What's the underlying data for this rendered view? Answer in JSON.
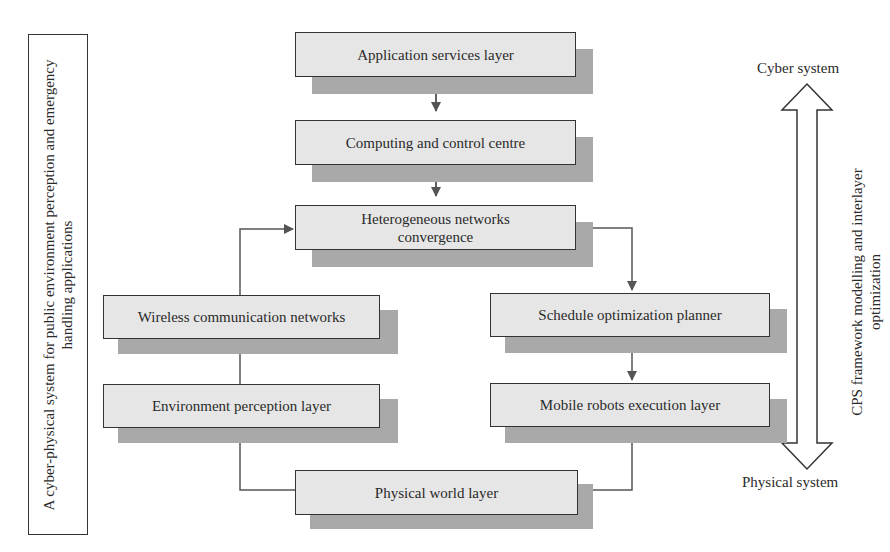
{
  "side_panel": {
    "label": "A cyber-physical system for public environment perception and emergency handling applications"
  },
  "nodes": {
    "application_services": "Application services layer",
    "computing_control": "Computing and control centre",
    "heterogeneous_networks": "Heterogeneous networks convergence",
    "wireless_networks": "Wireless communication networks",
    "schedule_planner": "Schedule optimization planner",
    "environment_perception": "Environment perception layer",
    "mobile_robots": "Mobile robots execution layer",
    "physical_world": "Physical world layer"
  },
  "axis": {
    "top_label": "Cyber system",
    "bottom_label": "Physical system",
    "side_label": "CPS framework modelling and interlayer optimization"
  },
  "colors": {
    "box_fill": "#e6e6e6",
    "shadow": "#a9a9a9",
    "line": "#555555",
    "border": "#333333"
  }
}
